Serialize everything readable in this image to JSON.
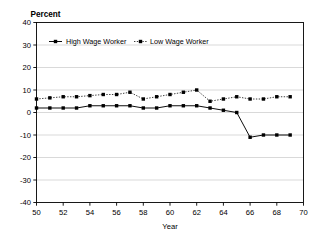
{
  "chart_data": {
    "type": "line",
    "title": "",
    "ylabel": "Percent",
    "xlabel": "Year",
    "xlim": [
      50,
      70
    ],
    "ylim": [
      -40,
      40
    ],
    "xticks": [
      50,
      52,
      54,
      56,
      58,
      60,
      62,
      64,
      66,
      68,
      70
    ],
    "xtick_labels": [
      "50",
      "52",
      "54",
      "56",
      "58",
      "60",
      "62",
      "64",
      "66",
      "68",
      "70"
    ],
    "yticks": [
      -40,
      -30,
      -20,
      -10,
      0,
      10,
      20,
      30,
      40
    ],
    "ytick_labels": [
      "-40",
      "-30",
      "-20",
      "-10",
      "0",
      "10",
      "20",
      "30",
      "40"
    ],
    "grid": true,
    "grid_axis": "y",
    "legend_position": "top-left-inside",
    "x": [
      50,
      51,
      52,
      53,
      54,
      55,
      56,
      57,
      58,
      59,
      60,
      61,
      62,
      63,
      64,
      65,
      66,
      67,
      68,
      69
    ],
    "series": [
      {
        "name": "High Wage Worker",
        "linestyle": "solid",
        "marker": "square",
        "color": "#000000",
        "values": [
          2,
          2,
          2,
          2,
          3,
          3,
          3,
          3,
          2,
          2,
          3,
          3,
          3,
          2,
          1,
          0,
          -11,
          -10,
          -10,
          -10
        ]
      },
      {
        "name": "Low Wage Worker",
        "linestyle": "dotted",
        "marker": "square",
        "color": "#000000",
        "values": [
          6,
          6,
          7,
          7,
          7,
          8,
          8,
          9,
          6,
          7,
          8,
          9,
          10,
          4,
          5,
          6,
          -4,
          -4,
          -7,
          -8
        ]
      }
    ],
    "series_overrides": {
      "Low Wage Worker": [
        6,
        6.5,
        7,
        7,
        7.5,
        8,
        8,
        9,
        6,
        7,
        8,
        9,
        10,
        5,
        6,
        7,
        6,
        6,
        7,
        7
      ]
    }
  },
  "legend": {
    "entries": [
      {
        "label": "High Wage Worker",
        "style": "solid"
      },
      {
        "label": "Low Wage Worker",
        "style": "dotted"
      }
    ]
  }
}
